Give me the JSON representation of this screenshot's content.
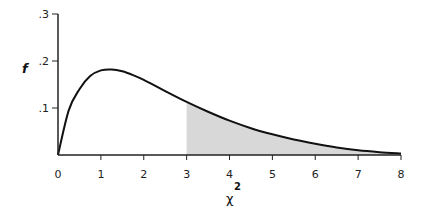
{
  "chart_data": {
    "type": "area",
    "title": "",
    "xlabel": "χ",
    "xlabel_superscript": "2",
    "ylabel": "f",
    "xlim": [
      0,
      8
    ],
    "ylim": [
      0,
      0.3
    ],
    "grid": false,
    "legend": null,
    "x_ticks": [
      "0",
      "1",
      "2",
      "3",
      "4",
      "5",
      "6",
      "7",
      "8"
    ],
    "y_ticks": [
      ".1",
      ".2",
      ".3"
    ],
    "series": [
      {
        "name": "chi-square density",
        "x": [
          0,
          0.25,
          0.5,
          0.75,
          1,
          1.25,
          1.5,
          1.75,
          2,
          2.5,
          3,
          3.5,
          4,
          4.5,
          5,
          5.5,
          6,
          6.5,
          7,
          7.5,
          8
        ],
        "values": [
          0,
          0.095,
          0.14,
          0.168,
          0.18,
          0.182,
          0.178,
          0.17,
          0.16,
          0.136,
          0.113,
          0.092,
          0.073,
          0.057,
          0.044,
          0.033,
          0.024,
          0.016,
          0.01,
          0.006,
          0.003
        ]
      }
    ],
    "shaded_region": {
      "from": 3,
      "to": 8,
      "color": "#d8d8d8"
    },
    "colors": {
      "line": "#111111",
      "axis": "#222222",
      "shade": "#d8d8d8"
    }
  }
}
